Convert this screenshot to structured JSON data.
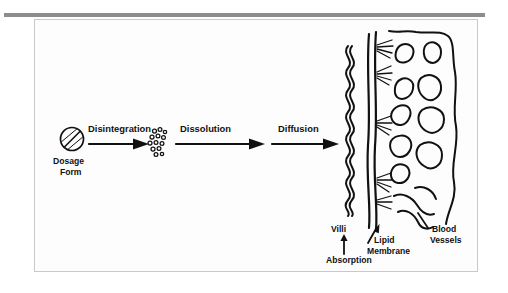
{
  "figure": {
    "background_color": "#fdfdfd",
    "ink_color": "#111111",
    "rule_color": "#8d8d8d",
    "frame_border_color": "#c9c9c9"
  },
  "stages": {
    "dosage_form_line1": "Dosage",
    "dosage_form_line2": "Form",
    "disintegration": "Disintegration",
    "dissolution": "Dissolution",
    "diffusion": "Diffusion"
  },
  "anatomy": {
    "villi": "Villi",
    "lipid_membrane_line1": "Lipid",
    "lipid_membrane_line2": "Membrane",
    "blood_vessels_line1": "Blood",
    "blood_vessels_line2": "Vessels",
    "absorption": "Absorption"
  },
  "icons": {
    "tablet": "tablet-icon",
    "particles": "drug-particles-icon",
    "arrow_disintegration": "arrow-right-icon",
    "arrow_dissolution": "arrow-right-icon",
    "arrow_diffusion": "arrow-right-icon",
    "arrow_absorption": "arrow-up-icon",
    "arrow_lipid_pointer": "arrow-diagonal-icon",
    "villi_wave": "villi-wave-icon",
    "membrane": "lipid-membrane-icon",
    "vessels": "blood-vessels-icon"
  },
  "counts": {
    "particle_count": 13,
    "villi_wave_cycles": 8
  }
}
